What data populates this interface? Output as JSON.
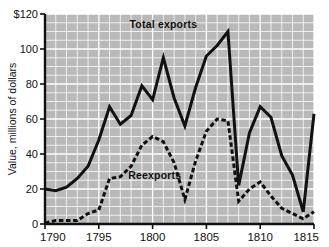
{
  "chart_data": {
    "type": "line",
    "title": "",
    "xlabel": "",
    "ylabel": "Value, millions of dollars",
    "xlim": [
      1790,
      1815
    ],
    "ylim": [
      0,
      120
    ],
    "grid": true,
    "grid_color": "#ffffff",
    "plot_background": "#b9b9b9",
    "legend_position": "inline-annotations",
    "x": [
      1790,
      1791,
      1792,
      1793,
      1794,
      1795,
      1796,
      1797,
      1798,
      1799,
      1800,
      1801,
      1802,
      1803,
      1804,
      1805,
      1806,
      1807,
      1808,
      1809,
      1810,
      1811,
      1812,
      1813,
      1814,
      1815
    ],
    "xticks": [
      1790,
      1795,
      1800,
      1805,
      1810,
      1815
    ],
    "xticklabels": [
      "1790",
      "1795",
      "1800",
      "1805",
      "1810",
      "1815"
    ],
    "yticks": [
      0,
      20,
      40,
      60,
      80,
      100,
      120
    ],
    "yticklabels": [
      "0",
      "20",
      "40",
      "60",
      "80",
      "100",
      "$120"
    ],
    "series": [
      {
        "name": "Total exports",
        "style": "solid",
        "color": "#111111",
        "width": 3.0,
        "label_x": 1801.0,
        "label_y": 112,
        "values": [
          20,
          19,
          21,
          26,
          33,
          48,
          67,
          57,
          62,
          79,
          71,
          95,
          72,
          56,
          78,
          96,
          102,
          110,
          22,
          52,
          67,
          61,
          39,
          28,
          7,
          63
        ]
      },
      {
        "name": "Reexports",
        "style": "dashed",
        "color": "#111111",
        "width": 3.0,
        "label_x": 1800.2,
        "label_y": 26,
        "values": [
          0.5,
          2,
          2,
          2,
          6,
          8,
          26,
          27,
          33,
          45,
          50,
          47,
          35,
          14,
          36,
          53,
          60,
          59,
          13,
          20,
          24,
          16,
          9,
          6,
          3,
          7
        ]
      }
    ]
  },
  "axis": {
    "y_title": "Value, millions of dollars"
  }
}
